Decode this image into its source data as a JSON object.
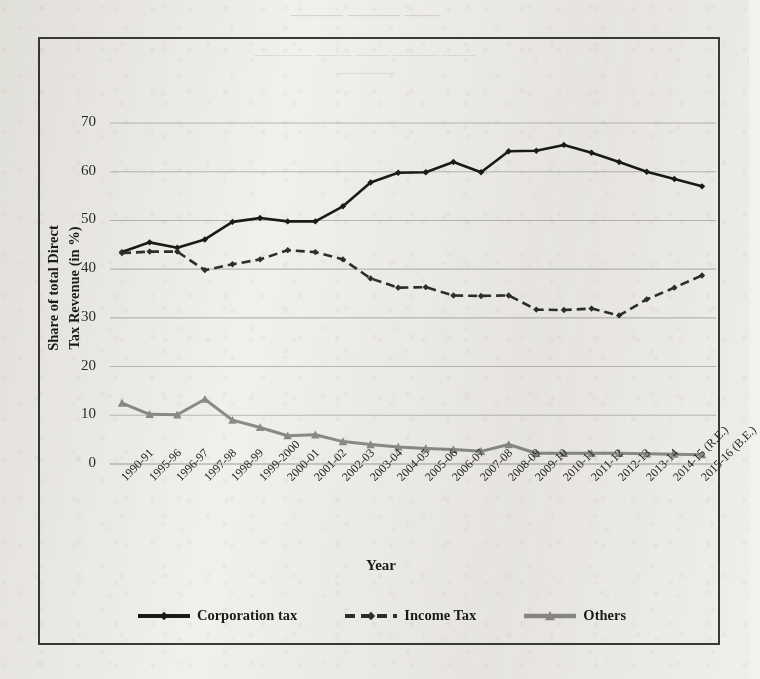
{
  "page": {
    "background_color": "#f2f1ee",
    "bleed_through_note": "faint illegible mirrored text bleeding through from reverse side of scanned page"
  },
  "bleed_through": {
    "title": "—— ——— ———",
    "line1": "——— —— ———— — ——— ————",
    "line2": "——— ———— ——— — —— —————",
    "line3": "—————"
  },
  "colors": {
    "corporation_tax": "#1a1a1a",
    "income_tax": "#2e2e2e",
    "others": "#8b8b88",
    "gridline": "#b9b9b4",
    "frame": "#3a3a38",
    "text": "#1c1c1b"
  },
  "chart_data": {
    "type": "line",
    "title": "",
    "xlabel": "Year",
    "ylabel": "Share of total Direct Tax Revenue (in %)",
    "ylim": [
      0,
      70
    ],
    "yticks": [
      0,
      10,
      20,
      30,
      40,
      50,
      60,
      70
    ],
    "grid": true,
    "legend_position": "bottom",
    "categories": [
      "1990-91",
      "1995-96",
      "1996-97",
      "1997-98",
      "1998-99",
      "1999-2000",
      "2000-01",
      "2001-02",
      "2002-03",
      "2003-04",
      "2004-05",
      "2005-06",
      "2006-07",
      "2007-08",
      "2008-09",
      "2009-10",
      "2010-11",
      "2011-12",
      "2012-13",
      "2013-14",
      "2014-15 (R.E.)",
      "2015-16 (B.E.)"
    ],
    "series": [
      {
        "name": "Corporation tax",
        "color": "#1a1a1a",
        "line_style": "solid",
        "marker": "diamond",
        "values": [
          43.5,
          45.5,
          44.4,
          46.1,
          49.7,
          50.5,
          49.8,
          49.8,
          52.9,
          57.8,
          59.8,
          59.9,
          62.0,
          59.9,
          64.2,
          64.3,
          65.5,
          63.9,
          62.0,
          60.0,
          58.5,
          57.0
        ]
      },
      {
        "name": "Income Tax",
        "color": "#2e2e2e",
        "line_style": "dashed",
        "marker": "diamond",
        "values": [
          43.3,
          43.6,
          43.6,
          39.8,
          41.0,
          42.0,
          43.9,
          43.5,
          42.0,
          38.1,
          36.2,
          36.3,
          34.6,
          34.5,
          34.6,
          31.7,
          31.6,
          31.9,
          30.5,
          33.8,
          36.2,
          38.7
        ]
      },
      {
        "name": "Others",
        "color": "#8b8b88",
        "line_style": "solid",
        "marker": "triangle",
        "values": [
          12.5,
          10.2,
          10.1,
          13.3,
          9.0,
          7.5,
          5.8,
          6.0,
          4.6,
          4.0,
          3.5,
          3.2,
          3.0,
          2.6,
          4.0,
          2.2,
          2.2,
          2.2,
          2.2,
          2.1,
          2.0,
          1.9
        ]
      }
    ]
  },
  "legend": {
    "items": [
      {
        "label": "Corporation tax"
      },
      {
        "label": "Income Tax"
      },
      {
        "label": "Others"
      }
    ]
  }
}
